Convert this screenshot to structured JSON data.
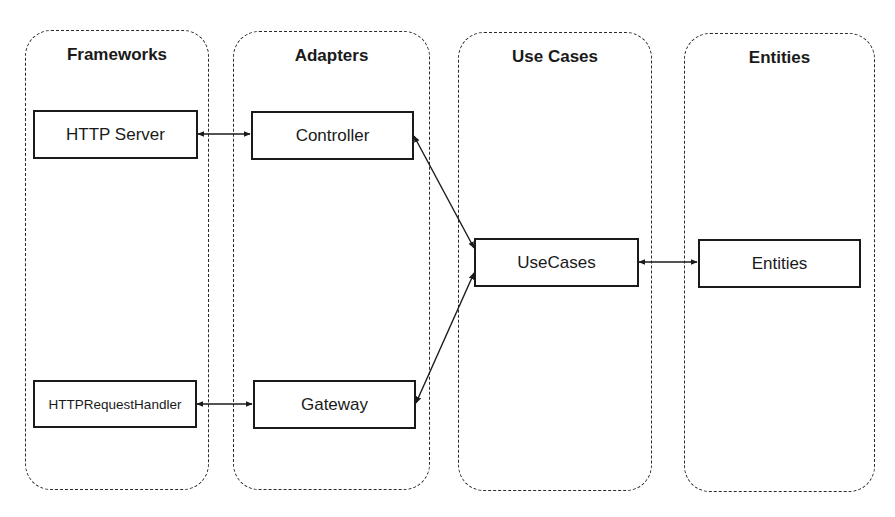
{
  "diagram": {
    "layers": [
      {
        "id": "frameworks",
        "title": "Frameworks"
      },
      {
        "id": "adapters",
        "title": "Adapters"
      },
      {
        "id": "use-cases",
        "title": "Use Cases"
      },
      {
        "id": "entities",
        "title": "Entities"
      }
    ],
    "nodes": {
      "http_server": "HTTP Server",
      "http_request_handler": "HTTPRequestHandler",
      "controller": "Controller",
      "gateway": "Gateway",
      "usecases": "UseCases",
      "entities": "Entities"
    },
    "edges": [
      {
        "from": "HTTP Server",
        "to": "Controller",
        "type": "bidirectional"
      },
      {
        "from": "HTTPRequestHandler",
        "to": "Gateway",
        "type": "bidirectional"
      },
      {
        "from": "Controller",
        "to": "UseCases",
        "type": "bidirectional"
      },
      {
        "from": "Gateway",
        "to": "UseCases",
        "type": "bidirectional"
      },
      {
        "from": "UseCases",
        "to": "Entities",
        "type": "bidirectional"
      }
    ]
  }
}
